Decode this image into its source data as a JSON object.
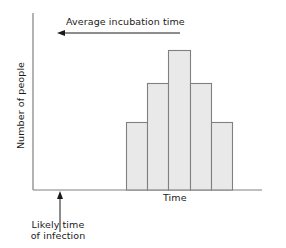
{
  "figure": {
    "title": "",
    "background_color": "#ffffff",
    "axis_color": "#808080",
    "text_color": "#1a1a1a"
  },
  "labels": {
    "incubation": "Average incubation time",
    "x_axis": "Time",
    "y_axis": "Number of people",
    "infection_line1": "Likely time",
    "infection_line2": "of infection"
  },
  "annotations": {
    "incubation_arrow": {
      "name": "average-incubation-time-arrow",
      "direction": "left",
      "x_start": 180,
      "x_end": 58,
      "y": 33
    },
    "infection_arrow": {
      "name": "likely-time-of-infection-arrow",
      "direction": "up",
      "x": 60,
      "y_start": 232,
      "y_end": 192
    }
  },
  "chart_data": {
    "type": "bar",
    "title": "",
    "xlabel": "Time",
    "ylabel": "Number of people",
    "grid": false,
    "legend": null,
    "categories": [
      "1",
      "2",
      "3",
      "4",
      "5"
    ],
    "values": [
      68,
      107,
      140,
      107,
      68
    ],
    "ylim": [
      0,
      177
    ],
    "xlim": [
      0,
      229
    ],
    "bar_fill": "#e9e9e9",
    "bar_stroke": "#808080",
    "bar_width_px": 21,
    "baseline_y_px": 190,
    "bars_px": [
      {
        "x": 126,
        "y_top": 122,
        "width": 21,
        "height": 68
      },
      {
        "x": 147,
        "y_top": 83,
        "width": 21,
        "height": 107
      },
      {
        "x": 168,
        "y_top": 50,
        "width": 22,
        "height": 140
      },
      {
        "x": 190,
        "y_top": 83,
        "width": 21,
        "height": 107
      },
      {
        "x": 211,
        "y_top": 122,
        "width": 21,
        "height": 68
      }
    ],
    "axes_px": {
      "y_axis_x": 33,
      "y_axis_top": 13,
      "y_axis_bottom": 190,
      "x_axis_y": 190,
      "x_axis_left": 33,
      "x_axis_right": 262
    }
  }
}
